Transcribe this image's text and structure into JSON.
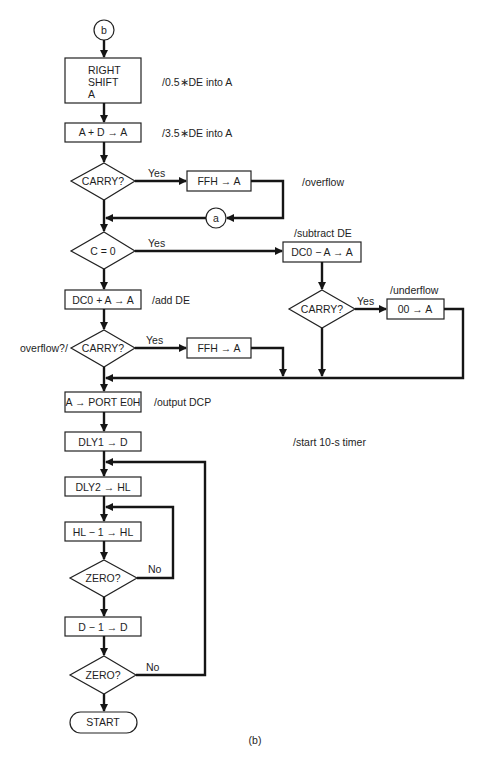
{
  "figure": {
    "caption": "(b)",
    "connectors": {
      "entry": "b",
      "return": "a"
    },
    "nodes": {
      "right_shift": [
        "RIGHT",
        "SHIFT",
        "A"
      ],
      "add_d": "A + D → A",
      "carry1": "CARRY?",
      "ffh1": "FFH → A",
      "c_zero": "C = 0",
      "sub": "DC0 − A → A",
      "add": "DC0 + A → A",
      "carry2": "CARRY?",
      "ffh2": "FFH → A",
      "carry3": "CARRY?",
      "zero_a": "00 → A",
      "port": "A → PORT E0H",
      "dly1": "DLY1 → D",
      "dly2": "DLY2 → HL",
      "dec_hl": "HL − 1 → HL",
      "zero1": "ZERO?",
      "dec_d": "D − 1 → D",
      "zero2": "ZERO?",
      "start": "START"
    },
    "edge_labels": {
      "carry1_yes": "Yes",
      "c_zero_yes": "Yes",
      "carry2_yes": "Yes",
      "carry3_yes": "Yes",
      "zero1_no": "No",
      "zero2_no": "No"
    },
    "comments": {
      "right_shift": "/0.5∗DE into A",
      "add_d": "/3.5∗DE into A",
      "ffh1": "/overflow",
      "sub": "/subtract DE",
      "add": "/add DE",
      "carry2": "overflow?/",
      "zero_a": "/underflow",
      "port": "/output DCP",
      "dly1": "/start 10-s timer"
    }
  }
}
